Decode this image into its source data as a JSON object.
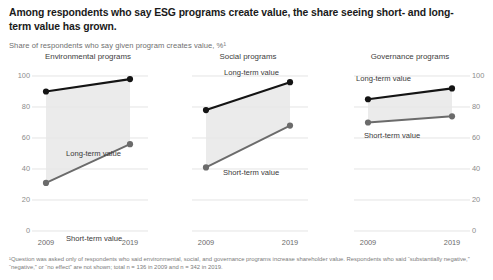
{
  "headline": "Among respondents who say ESG programs create value, the share seeing short- and long-term value has grown.",
  "subhead": "Share of respondents who say given program creates value, %¹",
  "footnote": "¹Question was asked only of respondents who said environmental, social, and governance programs increase shareholder value. Respondents who said “substantially negative,” “negative,” or “no effect” are not shown; total n = 136 in 2009 and n = 342 in 2019.",
  "colors": {
    "long_term": "#141414",
    "short_term": "#6b6b6b",
    "band": "#e8e8e8",
    "grid": "#d8d8d8",
    "axis_text": "#8c8c8c"
  },
  "chart_data": [
    {
      "type": "line",
      "title": "Environmental programs",
      "x": [
        "2009",
        "2019"
      ],
      "xlabel": "",
      "ylabel": "",
      "ylim": [
        0,
        100
      ],
      "yticks": [
        0,
        20,
        40,
        60,
        80,
        100
      ],
      "ytick_labels": [
        "0",
        "20",
        "40",
        "60",
        "80",
        "100"
      ],
      "axis_side": "left",
      "grid": true,
      "legend": "inline-labels",
      "series": [
        {
          "name": "Long-term value",
          "values": [
            90,
            98
          ],
          "color": "#141414",
          "label_x": 58,
          "label_y": 97
        },
        {
          "name": "Short-term value",
          "values": [
            31,
            56
          ],
          "color": "#6b6b6b",
          "label_x": 58,
          "label_y": 182
        }
      ]
    },
    {
      "type": "line",
      "title": "Social programs",
      "x": [
        "2009",
        "2019"
      ],
      "xlabel": "",
      "ylabel": "",
      "ylim": [
        0,
        100
      ],
      "yticks": [
        0,
        20,
        40,
        60,
        80,
        100
      ],
      "ytick_labels": [
        "0",
        "20",
        "40",
        "60",
        "80",
        "100"
      ],
      "axis_side": "none",
      "grid": true,
      "legend": "inline-labels",
      "series": [
        {
          "name": "Long-term value",
          "values": [
            78,
            96
          ],
          "color": "#141414",
          "label_x": 56,
          "label_y": 16
        },
        {
          "name": "Short-term value",
          "values": [
            41,
            68
          ],
          "color": "#6b6b6b",
          "label_x": 55,
          "label_y": 116
        }
      ]
    },
    {
      "type": "line",
      "title": "Governance programs",
      "x": [
        "2009",
        "2019"
      ],
      "xlabel": "",
      "ylabel": "",
      "ylim": [
        0,
        100
      ],
      "yticks": [
        0,
        20,
        40,
        60,
        80,
        100
      ],
      "ytick_labels": [
        "0",
        "20",
        "40",
        "60",
        "80",
        "100"
      ],
      "axis_side": "right",
      "grid": true,
      "legend": "inline-labels",
      "series": [
        {
          "name": "Long-term value",
          "values": [
            85,
            92
          ],
          "color": "#141414",
          "label_x": 26,
          "label_y": 22
        },
        {
          "name": "Short-term value",
          "values": [
            70,
            74
          ],
          "color": "#6b6b6b",
          "label_x": 34,
          "label_y": 79
        }
      ]
    }
  ]
}
